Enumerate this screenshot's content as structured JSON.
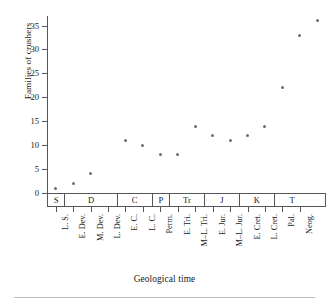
{
  "figure": {
    "title_remnant": "",
    "footer_rule": "horizontal-rule"
  },
  "axes": {
    "ylabel": "Families of crushers",
    "xlabel": "Geological time"
  },
  "chart_data": {
    "type": "scatter",
    "title": "",
    "xlabel": "Geological time",
    "ylabel": "Families of crushers",
    "ylim": [
      0,
      37
    ],
    "yticks": [
      0,
      5,
      10,
      15,
      20,
      25,
      30,
      35
    ],
    "ytick_labels": [
      "0",
      "5",
      "10",
      "15",
      "20",
      "25",
      "30",
      "35"
    ],
    "grid": false,
    "legend": "none",
    "categories": [
      "L. S.",
      "E. Dev.",
      "M. Dev.",
      "L. Dev.",
      "E. C.",
      "L. C.",
      "Perm.",
      "E. Tri.",
      "M–L. Tri.",
      "E. Jur.",
      "M–L. Jur.",
      "E. Cret.",
      "L. Cret.",
      "Pal.",
      "Neog."
    ],
    "values": [
      1,
      2,
      4,
      null,
      11,
      10,
      8,
      8,
      14,
      12,
      11,
      12,
      14,
      22,
      33
    ],
    "points": [
      {
        "category": "L. S.",
        "x_index": 0,
        "y": 1
      },
      {
        "category": "E. Dev.",
        "x_index": 1,
        "y": 2
      },
      {
        "category": "M. Dev.",
        "x_index": 2,
        "y": 4
      },
      {
        "category": "E. C.",
        "x_index": 4,
        "y": 11
      },
      {
        "category": "L. C.",
        "x_index": 5,
        "y": 10
      },
      {
        "category": "Perm.",
        "x_index": 6,
        "y": 8
      },
      {
        "category": "E. Tri.",
        "x_index": 7,
        "y": 8
      },
      {
        "category": "M–L. Tri.",
        "x_index": 8,
        "y": 14
      },
      {
        "category": "E. Jur.",
        "x_index": 9,
        "y": 12
      },
      {
        "category": "M–L. Jur.",
        "x_index": 10,
        "y": 11
      },
      {
        "category": "E. Cret.",
        "x_index": 11,
        "y": 12
      },
      {
        "category": "L. Cret.",
        "x_index": 12,
        "y": 14
      },
      {
        "category": "Pal.",
        "x_index": 13,
        "y": 22
      },
      {
        "category": "Neog.",
        "x_index": 14,
        "y": 33
      },
      {
        "category": "Neog.",
        "x_index": 15,
        "y": 36
      }
    ],
    "period_bands": [
      {
        "label": "S",
        "span": 1
      },
      {
        "label": "D",
        "span": 3
      },
      {
        "label": "C",
        "span": 2
      },
      {
        "label": "P",
        "span": 1
      },
      {
        "label": "Tr",
        "span": 2
      },
      {
        "label": "J",
        "span": 2
      },
      {
        "label": "K",
        "span": 2
      },
      {
        "label": "T",
        "span": 2
      }
    ],
    "marker_color": "#6e6e73",
    "axis_color": "#55555a"
  }
}
